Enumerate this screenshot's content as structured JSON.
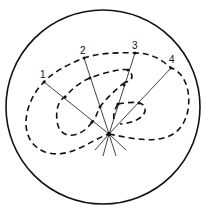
{
  "diagram": {
    "colors": {
      "stroke": "#111111",
      "background": "#ffffff"
    },
    "ray_labels": [
      "1",
      "2",
      "3",
      "4"
    ],
    "center_point": "origin of rays"
  }
}
